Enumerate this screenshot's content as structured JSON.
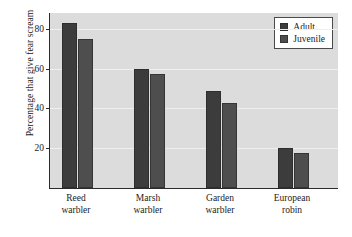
{
  "chart_data": {
    "type": "bar",
    "title": "",
    "subtitle": "",
    "xlabel": "",
    "ylabel": "Percentage that give fear scream",
    "categories": [
      "Reed warbler",
      "Marsh warbler",
      "Garden warbler",
      "European robin"
    ],
    "category_lines": [
      [
        "Reed",
        "warbler"
      ],
      [
        "Marsh",
        "warbler"
      ],
      [
        "Garden",
        "warbler"
      ],
      [
        "European",
        "robin"
      ]
    ],
    "series": [
      {
        "name": "Adult",
        "values": [
          83,
          60,
          49,
          20
        ],
        "color": "#3c3c3c"
      },
      {
        "name": "Juvenile",
        "values": [
          75,
          57.5,
          42.5,
          17.5
        ],
        "color": "#4e4e4e"
      }
    ],
    "ylim": [
      0,
      88
    ],
    "yticks": [
      20,
      40,
      60,
      80
    ],
    "ytick_labels": [
      "20",
      "40",
      "60",
      "80"
    ],
    "grid": true,
    "legend_position": "top-right",
    "plot_background": "#dcdcdc",
    "figure_background": "#ffffff",
    "axis_color": "#2b2b2b"
  },
  "legend": {
    "entries": [
      {
        "label": "Adult"
      },
      {
        "label": "Juvenile"
      }
    ]
  }
}
